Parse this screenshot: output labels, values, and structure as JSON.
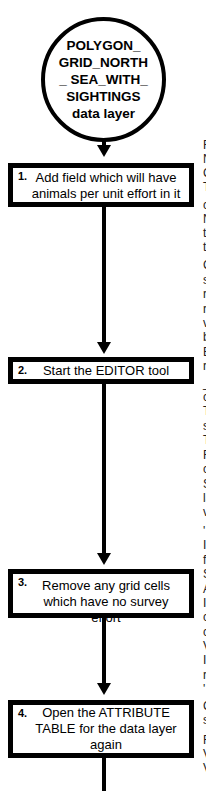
{
  "start_node": {
    "label": "POLYGON_ GRID_NORTH_ SEA_WITH_ SIGHTINGS data layer"
  },
  "steps": [
    {
      "number": "1.",
      "text": "Add field which will have animals per unit effort in it"
    },
    {
      "number": "2.",
      "text": "Start the EDITOR tool"
    },
    {
      "number": "3.",
      "text": "Remove any grid cells which have no survey effort"
    },
    {
      "number": "4.",
      "text": "Open the ATTRIBUTE TABLE for the data layer again"
    }
  ],
  "right_column_fragments": [
    {
      "y": 145,
      "text": "F"
    },
    {
      "y": 159,
      "text": "N"
    },
    {
      "y": 173,
      "text": "C"
    },
    {
      "y": 187,
      "text": "T"
    },
    {
      "y": 205,
      "text": "c"
    },
    {
      "y": 219,
      "text": "N"
    },
    {
      "y": 233,
      "text": "t"
    },
    {
      "y": 247,
      "text": "t"
    },
    {
      "y": 265,
      "text": "C"
    },
    {
      "y": 280,
      "text": "s"
    },
    {
      "y": 294,
      "text": "r"
    },
    {
      "y": 309,
      "text": "r"
    },
    {
      "y": 323,
      "text": "v"
    },
    {
      "y": 337,
      "text": "b"
    },
    {
      "y": 352,
      "text": "E"
    },
    {
      "y": 366,
      "text": "r"
    },
    {
      "y": 383,
      "text": "_"
    },
    {
      "y": 397,
      "text": "c"
    },
    {
      "y": 411,
      "text": "T"
    },
    {
      "y": 426,
      "text": "s"
    },
    {
      "y": 440,
      "text": "T"
    },
    {
      "y": 455,
      "text": "F"
    },
    {
      "y": 469,
      "text": "c"
    },
    {
      "y": 484,
      "text": "S"
    },
    {
      "y": 498,
      "text": "la"
    },
    {
      "y": 512,
      "text": "v"
    },
    {
      "y": 531,
      "text": "'"
    },
    {
      "y": 545,
      "text": "I"
    },
    {
      "y": 560,
      "text": "f"
    },
    {
      "y": 574,
      "text": "S"
    },
    {
      "y": 589,
      "text": "A"
    },
    {
      "y": 603,
      "text": "I"
    },
    {
      "y": 617,
      "text": "c"
    },
    {
      "y": 632,
      "text": "c"
    },
    {
      "y": 646,
      "text": "V"
    },
    {
      "y": 660,
      "text": "I"
    },
    {
      "y": 675,
      "text": "r"
    },
    {
      "y": 689,
      "text": "'"
    },
    {
      "y": 706,
      "text": "C"
    },
    {
      "y": 720,
      "text": "s"
    },
    {
      "y": 740,
      "text": "F"
    },
    {
      "y": 754,
      "text": "V"
    },
    {
      "y": 768,
      "text": "V"
    }
  ]
}
